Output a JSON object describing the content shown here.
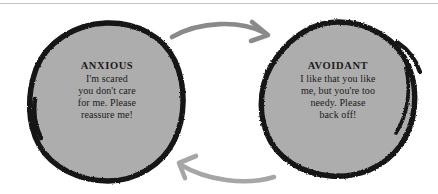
{
  "diagram": {
    "type": "cycle",
    "background_color": "#ffffff",
    "node_fill_color": "#adadad",
    "node_stroke_color": "#141414",
    "arrow_color": "#8a8a8a",
    "text_color": "#1b1b1b",
    "rule_color": "#c3c3c6",
    "nodes": [
      {
        "id": "anxious",
        "title": "ANXIOUS",
        "body": "I'm scared you don't care for me. Please reassure me!",
        "body_lines": [
          "I'm scared",
          "you don't care",
          "for me. Please",
          "reassure me!"
        ]
      },
      {
        "id": "avoidant",
        "title": "AVOIDANT",
        "body": "I like that you like me, but you're too needy. Please back off!",
        "body_lines": [
          "I like that you like",
          "me, but you're too",
          "needy. Please",
          "back off!"
        ]
      }
    ],
    "arrows": [
      {
        "id": "top-arrow",
        "from": "anxious",
        "to": "avoidant",
        "direction": "left-to-right"
      },
      {
        "id": "bottom-arrow",
        "from": "avoidant",
        "to": "anxious",
        "direction": "right-to-left"
      }
    ]
  }
}
